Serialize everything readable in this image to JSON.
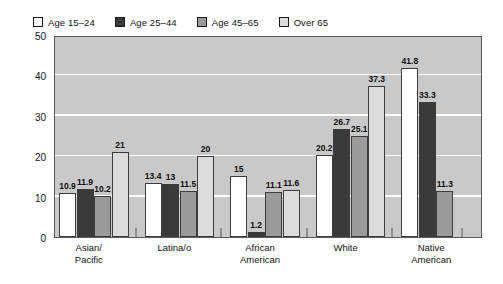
{
  "chart_data": {
    "type": "bar",
    "title": "",
    "subtitle": "",
    "xlabel": "",
    "ylabel": "",
    "grid": true,
    "legend_position": "top-left",
    "ylim": [
      0,
      50
    ],
    "yticks": [
      0,
      10,
      20,
      30,
      40,
      50
    ],
    "ytick_labels": [
      "0",
      "10",
      "20",
      "30",
      "40",
      "50"
    ],
    "categories": [
      "Asian/\nPacific",
      "Latina/o",
      "African\nAmerican",
      "White",
      "Native\nAmerican"
    ],
    "category_lines": [
      [
        "Asian/",
        "Pacific"
      ],
      [
        "Latina/o",
        ""
      ],
      [
        "African",
        "American"
      ],
      [
        "White",
        ""
      ],
      [
        "Native",
        "American"
      ]
    ],
    "series": [
      {
        "name": "Age 15–24",
        "color": "#ffffff",
        "values": [
          10.9,
          13.4,
          15,
          20.2,
          41.8
        ],
        "labels": [
          "10.9",
          "13.4",
          "15",
          "20.2",
          "41.8"
        ]
      },
      {
        "name": "Age 25–44",
        "color": "#3a3a3a",
        "values": [
          11.9,
          13,
          1.2,
          26.7,
          33.3
        ],
        "labels": [
          "11.9",
          "13",
          "1.2",
          "26.7",
          "33.3"
        ]
      },
      {
        "name": "Age 45–65",
        "color": "#9a9a9a",
        "values": [
          10.2,
          11.5,
          11.1,
          25.1,
          11.3
        ],
        "labels": [
          "10.2",
          "11.5",
          "11.1",
          "25.1",
          "11.3"
        ]
      },
      {
        "name": "Over 65",
        "color": "#dcdcdc",
        "values": [
          21,
          20,
          11.6,
          37.3,
          null
        ],
        "labels": [
          "21",
          "20",
          "11.6",
          "37.3",
          ""
        ]
      }
    ]
  },
  "legend": {
    "items": [
      {
        "label": "Age 15–24",
        "swatch": "#ffffff"
      },
      {
        "label": "Age 25–44",
        "swatch": "#3a3a3a"
      },
      {
        "label": "Age 45–65",
        "swatch": "#9a9a9a"
      },
      {
        "label": "Over 65",
        "swatch": "#dcdcdc"
      }
    ]
  },
  "colors": {
    "plot_background": "#c9c9c9",
    "gridline": "#ffffff",
    "frame": "#5a5a5a",
    "bar_outline": "#3c3c3c",
    "text": "#141414"
  }
}
